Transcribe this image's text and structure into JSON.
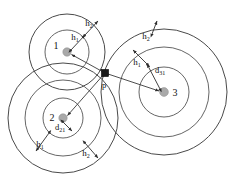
{
  "figure": {
    "background_color": "#ffffff",
    "stroke_color": "#555555",
    "node_fill_color": "#a9a9a9",
    "point_marker_color": "#1a1a1a"
  },
  "nodes": [
    {
      "id": "node-1",
      "label": "1",
      "cx": 67,
      "cy": 52,
      "dot_r": 4.2,
      "label_x": 56,
      "label_y": 49,
      "rings": [
        22,
        38
      ]
    },
    {
      "id": "node-2",
      "label": "2",
      "cx": 63,
      "cy": 118,
      "dot_r": 4.2,
      "label_x": 52,
      "label_y": 118,
      "rings": [
        20,
        38,
        55
      ]
    },
    {
      "id": "node-3",
      "label": "3",
      "cx": 164,
      "cy": 92,
      "dot_r": 4.4,
      "label_x": 174,
      "label_y": 94,
      "rings": [
        25,
        45,
        63
      ]
    }
  ],
  "point": {
    "id": "point-p",
    "label": "p",
    "x": 105,
    "y": 73,
    "size": 7,
    "label_x": 103,
    "label_y": 88
  },
  "measures": {
    "h1": {
      "symbol": "h",
      "subscript": "1",
      "description": "inner ring band width"
    },
    "h2": {
      "symbol": "h",
      "subscript": "2",
      "description": "outer ring band width"
    },
    "d21": {
      "symbol": "d",
      "subscript": "21",
      "description": "distance from node 2 to point p"
    },
    "d31": {
      "symbol": "d",
      "subscript": "31",
      "description": "distance from node 3 to point p"
    }
  },
  "annotations": [
    {
      "id": "ann-n1-h1",
      "symbol": "h",
      "subscript": "1",
      "x": 79,
      "y": 40
    },
    {
      "id": "ann-n1-h2",
      "symbol": "h",
      "subscript": "2",
      "x": 93,
      "y": 26
    },
    {
      "id": "ann-n2-h1",
      "symbol": "h",
      "subscript": "1",
      "x": 36,
      "y": 146
    },
    {
      "id": "ann-n2-h2",
      "symbol": "h",
      "subscript": "2",
      "x": 83,
      "y": 155
    },
    {
      "id": "ann-n2-d21",
      "symbol": "d",
      "subscript": "21",
      "x": 58,
      "y": 128
    },
    {
      "id": "ann-n3-h1",
      "symbol": "h",
      "subscript": "1",
      "x": 134,
      "y": 64
    },
    {
      "id": "ann-n3-h2",
      "symbol": "h",
      "subscript": "2",
      "x": 144,
      "y": 38
    },
    {
      "id": "ann-n3-d31",
      "symbol": "d",
      "subscript": "31",
      "x": 156,
      "y": 73
    }
  ]
}
